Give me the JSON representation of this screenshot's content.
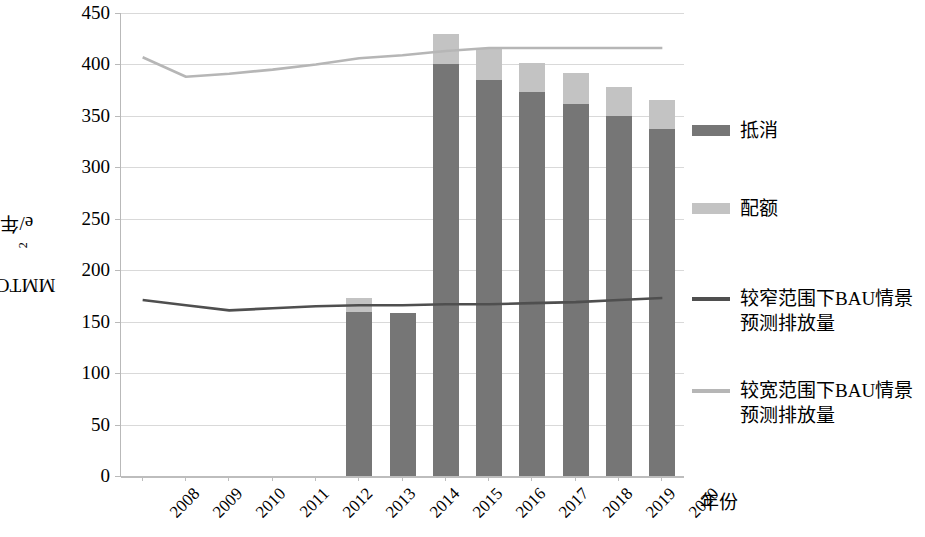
{
  "chart_data": {
    "type": "bar",
    "title": "",
    "subtitle": "",
    "xlabel": "年份",
    "ylabel": "MMTCO2e/年",
    "ylabel_parts": {
      "pre": "MMTCO",
      "sub": "2",
      "post": "e/年"
    },
    "ylim": [
      0,
      450
    ],
    "ytick_step": 50,
    "yticks": [
      0,
      50,
      100,
      150,
      200,
      250,
      300,
      350,
      400,
      450
    ],
    "grid": true,
    "legend_position": "right",
    "categories": [
      "2008",
      "2009",
      "2010",
      "2011",
      "2012",
      "2013",
      "2014",
      "2015",
      "2016",
      "2017",
      "2018",
      "2019",
      "2020"
    ],
    "stacked": true,
    "series": [
      {
        "name": "抵消",
        "kind": "bar",
        "color": "#767676",
        "values": [
          null,
          null,
          null,
          null,
          null,
          159,
          158,
          400,
          385,
          373,
          362,
          350,
          337
        ]
      },
      {
        "name": "配额",
        "kind": "bar",
        "color": "#c3c3c3",
        "values": [
          null,
          null,
          null,
          null,
          null,
          14,
          0,
          30,
          31,
          28,
          30,
          28,
          28
        ]
      },
      {
        "name": "较窄范围下BAU情景\n预测排放量",
        "kind": "line",
        "color": "#4f4f4f",
        "values": [
          171,
          166,
          161,
          163,
          165,
          166,
          166,
          167,
          167,
          168,
          169,
          171,
          173
        ]
      },
      {
        "name": "较宽范围下BAU情景\n预测排放量",
        "kind": "line",
        "color": "#b6b6b6",
        "values": [
          407,
          388,
          391,
          395,
          400,
          406,
          409,
          413,
          416,
          416,
          416,
          416,
          416
        ]
      }
    ],
    "bar_totals": [
      null,
      null,
      null,
      null,
      null,
      173,
      158,
      430,
      416,
      401,
      392,
      378,
      365
    ],
    "annotations": []
  },
  "legend": {
    "items": [
      {
        "label": "抵消",
        "swatch": "bar",
        "color": "#767676",
        "name": "legend-offset"
      },
      {
        "label": "配额",
        "swatch": "bar",
        "color": "#c3c3c3",
        "name": "legend-allowance"
      },
      {
        "label": "较窄范围下BAU情景\n预测排放量",
        "swatch": "line",
        "color": "#4f4f4f",
        "name": "legend-narrow-bau"
      },
      {
        "label": "较宽范围下BAU情景\n预测排放量",
        "swatch": "line",
        "color": "#b6b6b6",
        "name": "legend-wide-bau"
      }
    ]
  }
}
